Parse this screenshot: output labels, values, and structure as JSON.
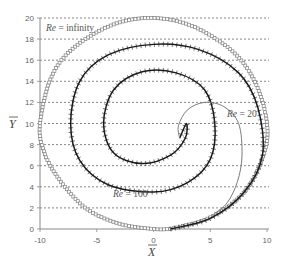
{
  "chart_data": {
    "type": "line",
    "title": "",
    "xlabel": "X̄",
    "ylabel": "Ȳ",
    "xlim": [
      -10,
      10
    ],
    "ylim": [
      0,
      20
    ],
    "xticks": [
      -10,
      -5,
      0,
      5,
      10
    ],
    "yticks": [
      0,
      2,
      4,
      6,
      8,
      10,
      12,
      14,
      16,
      18,
      20
    ],
    "grid": "horizontal dashed",
    "legend": "none (inline annotations)",
    "annotations": [
      {
        "text": "Re = infinity",
        "x": -9.5,
        "y": 19.1
      },
      {
        "text": "Re = 20",
        "x": 5.6,
        "y": 10.8
      },
      {
        "text": "Re = 100",
        "x": -1.6,
        "y": 3.4
      }
    ],
    "series": [
      {
        "name": "Re = infinity",
        "style": "gray square markers",
        "description": "near-circular path centred at (0,10), radius ~10",
        "x": [
          1.5,
          5,
          8,
          9.7,
          10,
          9,
          7,
          3.5,
          0,
          -3.5,
          -7,
          -9,
          -10,
          -9.7,
          -8.5,
          -6,
          -3,
          0,
          1.5
        ],
        "y": [
          0,
          1.1,
          3.5,
          7,
          10,
          13.8,
          16.8,
          19.2,
          20,
          19.4,
          17.2,
          14.4,
          10,
          7.5,
          5,
          2,
          0.5,
          0,
          0
        ]
      },
      {
        "name": "Re = 100",
        "style": "black line with cross ticks",
        "description": "inward spiral toward (2.5, 9.5)",
        "x": [
          1.5,
          5,
          8,
          9.6,
          9.2,
          7.5,
          4,
          0,
          -4,
          -6.5,
          -7.3,
          -6.5,
          -4,
          0,
          3,
          5,
          5.4,
          4.5,
          2,
          -1,
          -3.5,
          -4.4,
          -3.5,
          -1,
          1.5,
          2.8,
          2.9,
          2.3
        ],
        "y": [
          0,
          1,
          3.5,
          7,
          11.5,
          14.8,
          17,
          17.5,
          16.5,
          14,
          10,
          6.5,
          4.2,
          3.5,
          4.4,
          6.6,
          10,
          13.2,
          14.8,
          14.9,
          13.2,
          10,
          7.2,
          6.2,
          7,
          8.6,
          10,
          8.6
        ]
      },
      {
        "name": "Re = 20",
        "style": "thin gray line",
        "description": "short loop from (2.3, 8.6) out to right then down to merge at bottom right",
        "x": [
          2.3,
          2.2,
          3,
          4.5,
          6.2,
          7.5,
          7.8,
          7.4,
          6.5,
          5.3
        ],
        "y": [
          8.6,
          9.8,
          11.3,
          12,
          11.6,
          10,
          7,
          4.5,
          2.5,
          1.4
        ]
      }
    ]
  },
  "axes": {
    "x_title": "X",
    "y_title": "Y",
    "x_tick_labels": [
      "-10",
      "-5",
      "0",
      "5",
      "10"
    ],
    "y_tick_labels": [
      "0",
      "2",
      "4",
      "6",
      "8",
      "10",
      "12",
      "14",
      "16",
      "18",
      "20"
    ]
  },
  "labels": {
    "re_inf_prefix": "Re",
    "re_inf_suffix": " = infinity",
    "re20_prefix": "Re",
    "re20_suffix": " = 20",
    "re100_prefix": "Re",
    "re100_suffix": " = 100"
  },
  "colors": {
    "grid": "#555555",
    "axis": "#888888",
    "re_inf": "#808080",
    "re100": "#1a1a1a",
    "re20": "#7a7a7a"
  }
}
